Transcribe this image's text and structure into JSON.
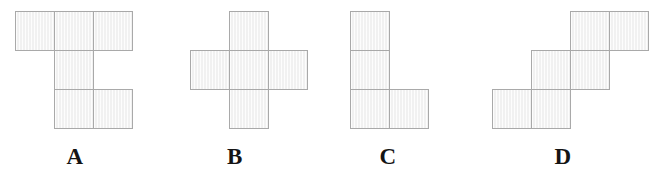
{
  "page": {
    "background_color": "#ffffff",
    "width": 667,
    "height": 182
  },
  "style": {
    "cell_size": 39,
    "cell_fill": "#f1f1f1",
    "cell_border": "#a9a9a9",
    "label_color": "#141414"
  },
  "figures": [
    {
      "id": "A",
      "label": "A",
      "label_x": 63,
      "label_y": 144,
      "origin_x": 15,
      "origin_y": 11,
      "description": "Three squares across the top row, one square below the middle column, two squares on the bottom row at the middle and right columns",
      "cells": [
        {
          "col": 0,
          "row": 0
        },
        {
          "col": 1,
          "row": 0
        },
        {
          "col": 2,
          "row": 0
        },
        {
          "col": 1,
          "row": 1
        },
        {
          "col": 1,
          "row": 2
        },
        {
          "col": 2,
          "row": 2
        }
      ]
    },
    {
      "id": "B",
      "label": "B",
      "label_x": 223,
      "label_y": 144,
      "origin_x": 190,
      "origin_y": 11,
      "description": "Plus sign made of five squares: one centre square with one square on each of the four sides",
      "cells": [
        {
          "col": 1,
          "row": 0
        },
        {
          "col": 0,
          "row": 1
        },
        {
          "col": 1,
          "row": 1
        },
        {
          "col": 2,
          "row": 1
        },
        {
          "col": 1,
          "row": 2
        }
      ]
    },
    {
      "id": "C",
      "label": "C",
      "label_x": 376,
      "label_y": 144,
      "origin_x": 350,
      "origin_y": 11,
      "description": "L shape: a vertical column of three squares with one extra square to the right of the bottom square",
      "cells": [
        {
          "col": 0,
          "row": 0
        },
        {
          "col": 0,
          "row": 1
        },
        {
          "col": 0,
          "row": 2
        },
        {
          "col": 1,
          "row": 2
        }
      ]
    },
    {
      "id": "D",
      "label": "D",
      "label_x": 551,
      "label_y": 144,
      "origin_x": 492,
      "origin_y": 11,
      "description": "Descending staircase of three offset dominoes: top pair at the right, middle pair shifted one column left and one row down, bottom pair shifted one more column left and row down",
      "cells": [
        {
          "col": 2,
          "row": 0
        },
        {
          "col": 3,
          "row": 0
        },
        {
          "col": 1,
          "row": 1
        },
        {
          "col": 2,
          "row": 1
        },
        {
          "col": 0,
          "row": 2
        },
        {
          "col": 1,
          "row": 2
        }
      ]
    }
  ]
}
